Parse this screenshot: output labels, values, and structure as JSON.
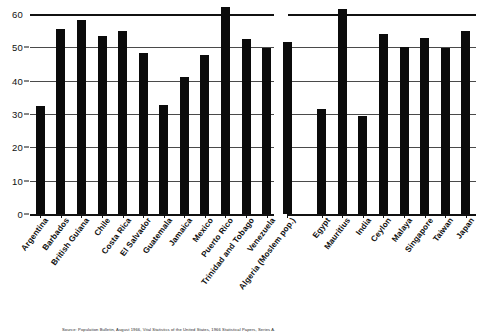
{
  "chart_data": {
    "type": "bar",
    "title": "",
    "xlabel": "",
    "ylabel": "",
    "ylim": [
      0,
      60
    ],
    "yticks": [
      0,
      10,
      20,
      30,
      40,
      50,
      60
    ],
    "grid": true,
    "legend": null,
    "categories": [
      "Argentina",
      "Barbados",
      "British Guiana",
      "Chile",
      "Costa Rica",
      "El Salvador",
      "Guatemala",
      "Jamaica",
      "Mexico",
      "Puerto Rico",
      "Trinidad and Tobago",
      "Venezuela",
      "Algeria (Moslem pop.)",
      "Egypt",
      "Mauritius",
      "India",
      "Ceylon",
      "Malaya",
      "Singapore",
      "Taiwan",
      "Japan"
    ],
    "values": [
      32.5,
      55.5,
      58.3,
      53.3,
      54.8,
      48.3,
      32.7,
      41.2,
      47.6,
      62.0,
      52.4,
      49.8,
      51.5,
      31.6,
      61.5,
      29.5,
      54.0,
      50.0,
      52.8,
      49.8,
      55.0
    ],
    "groups": [
      {
        "name": "group-left",
        "start": 0,
        "end": 12
      },
      {
        "name": "group-right",
        "start": 13,
        "end": 20
      }
    ]
  },
  "caption": {
    "source_text": "Source: Population Bulletin, August 1966, Vital Statistics of the United States, 1966 Statistical Papers, Series A."
  }
}
